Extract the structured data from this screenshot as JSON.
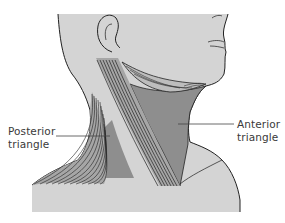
{
  "diagram": {
    "labels": [
      {
        "id": "posterior",
        "line1": "Posterior",
        "line2": "triangle"
      },
      {
        "id": "anterior",
        "line1": "Anterior",
        "line2": "triangle"
      }
    ],
    "colors": {
      "skin": "#d4d4d4",
      "triangle_fill": "#8e8e8e",
      "muscle_fill": "#a6a6a6",
      "outline": "#222222",
      "leader_line": "#444444",
      "background": "#ffffff"
    }
  }
}
